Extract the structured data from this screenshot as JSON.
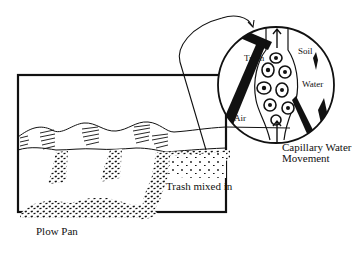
{
  "diagram": {
    "title": "",
    "colors": {
      "ink": "#111111",
      "background": "#ffffff"
    },
    "cross_section": {
      "labels": {
        "trash_mixed_in": "Trash mixed in",
        "plow_pan": "Plow Pan"
      }
    },
    "magnified_view": {
      "labels": {
        "trash": "Trash",
        "soil": "Soil",
        "water": "Water",
        "air": "Air",
        "capillary": "Capillary Water Movement"
      }
    }
  }
}
